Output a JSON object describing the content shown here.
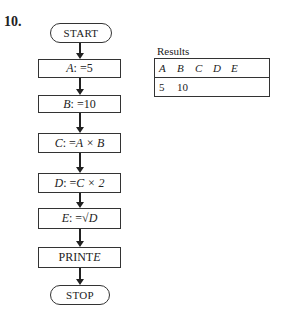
{
  "problem_number": "10.",
  "flowchart": {
    "start": "START",
    "steps": [
      {
        "var": "A",
        "op": ": = ",
        "expr": "5"
      },
      {
        "var": "B",
        "op": ": = ",
        "expr": "10"
      },
      {
        "var": "C",
        "op": ": = ",
        "expr": "A × B"
      },
      {
        "var": "D",
        "op": ": = ",
        "expr": "C × 2"
      },
      {
        "var": "E",
        "op": ": = ",
        "expr": "√D"
      },
      {
        "var": "",
        "op": "PRINT ",
        "expr": "E"
      }
    ],
    "stop": "STOP"
  },
  "results": {
    "label": "Results",
    "headers": [
      "A",
      "B",
      "C",
      "D",
      "E"
    ],
    "values": [
      "5",
      "10",
      "",
      "",
      ""
    ]
  }
}
